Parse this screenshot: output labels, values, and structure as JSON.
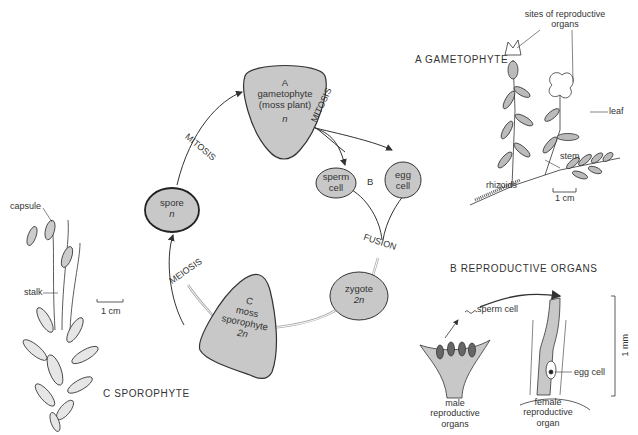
{
  "cycle": {
    "gametophyte": {
      "letter": "A",
      "line1": "gametophyte",
      "line2": "(moss plant)",
      "ploidy": "n"
    },
    "sperm": {
      "line1": "sperm",
      "line2": "cell"
    },
    "egg": {
      "line1": "egg",
      "line2": "cell"
    },
    "b_label": "B",
    "zygote": {
      "line1": "zygote",
      "ploidy": "2n"
    },
    "sporophyte": {
      "letter": "C",
      "line1": "moss",
      "line2": "sporophyte",
      "ploidy": "2n"
    },
    "spore": {
      "line1": "spore",
      "ploidy": "n"
    },
    "processes": {
      "mitosis_left": "MITOSIS",
      "mitosis_right": "MITOSIS",
      "fusion": "FUSION",
      "meiosis": "MEIOSIS"
    }
  },
  "panel_a": {
    "title": "A GAMETOPHYTE",
    "labels": {
      "sites_line1": "sites of reproductive",
      "sites_line2": "organs",
      "leaf": "leaf",
      "stem": "stem",
      "rhizoids": "rhizoids"
    },
    "scale": "1 cm"
  },
  "panel_b": {
    "title": "B REPRODUCTIVE ORGANS",
    "labels": {
      "sperm_cell": "sperm cell",
      "egg_cell": "egg cell",
      "male_line1": "male",
      "male_line2": "reproductive",
      "male_line3": "organs",
      "female_line1": "female",
      "female_line2": "reproductive",
      "female_line3": "organ"
    },
    "scale": "1 mm"
  },
  "panel_c": {
    "title": "C SPOROPHYTE",
    "labels": {
      "capsule": "capsule",
      "stalk": "stalk"
    },
    "scale": "1 cm"
  },
  "colors": {
    "fill": "#c8c8c8",
    "stroke": "#333333",
    "light_fill": "#d6d6d6"
  }
}
